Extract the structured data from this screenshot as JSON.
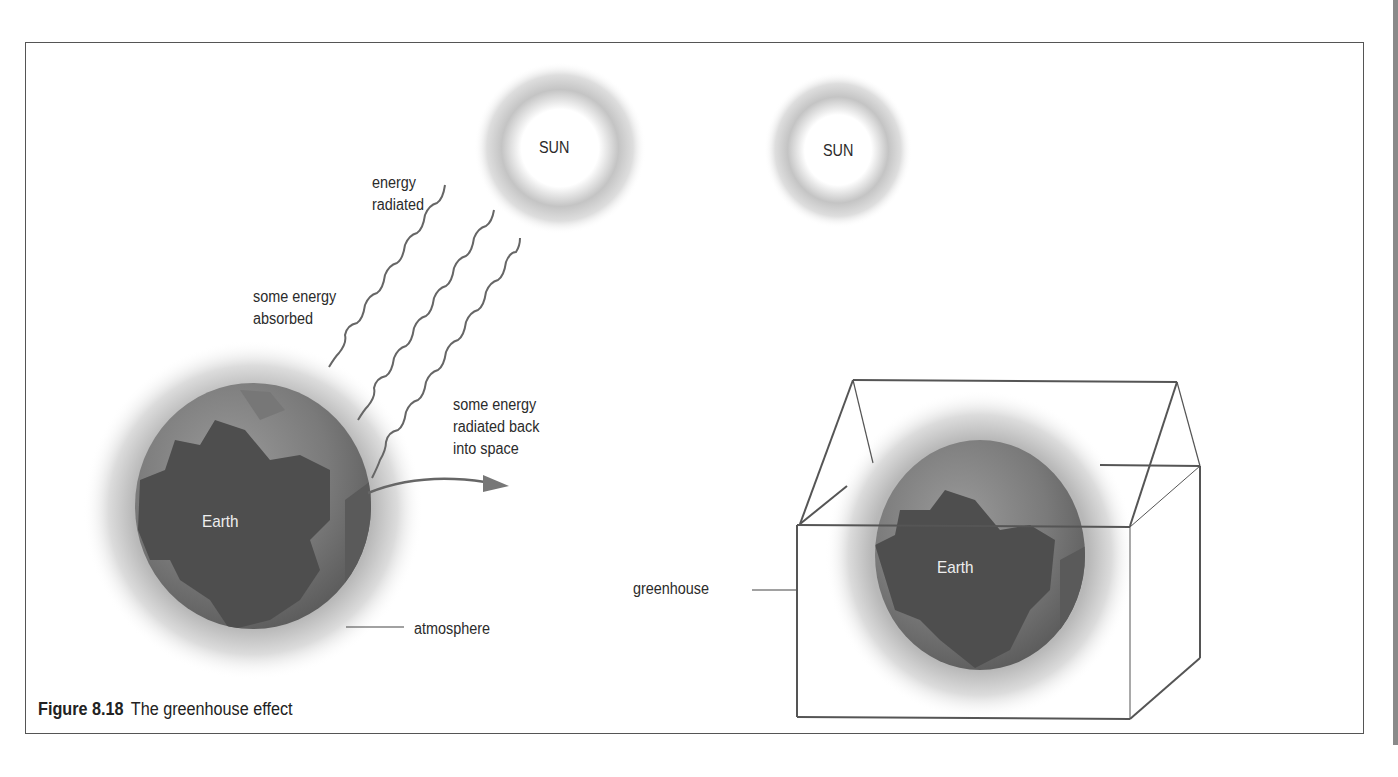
{
  "figure": {
    "number": "Figure 8.18",
    "title": "The greenhouse effect"
  },
  "left_panel": {
    "sun_label": "SUN",
    "energy_radiated_label": "energy\nradiated",
    "energy_absorbed_label": "some energy\nabsorbed",
    "energy_back_label": "some energy\nradiated back\ninto space",
    "earth_label": "Earth",
    "atmosphere_label": "atmosphere"
  },
  "right_panel": {
    "sun_label": "SUN",
    "earth_label": "Earth",
    "greenhouse_label": "greenhouse"
  },
  "colors": {
    "border": "#555555",
    "earth_dark": "#4a4a4a",
    "earth_light": "#8c8c8c",
    "glow": "#bdbdbd",
    "text": "#2b2b2b"
  }
}
